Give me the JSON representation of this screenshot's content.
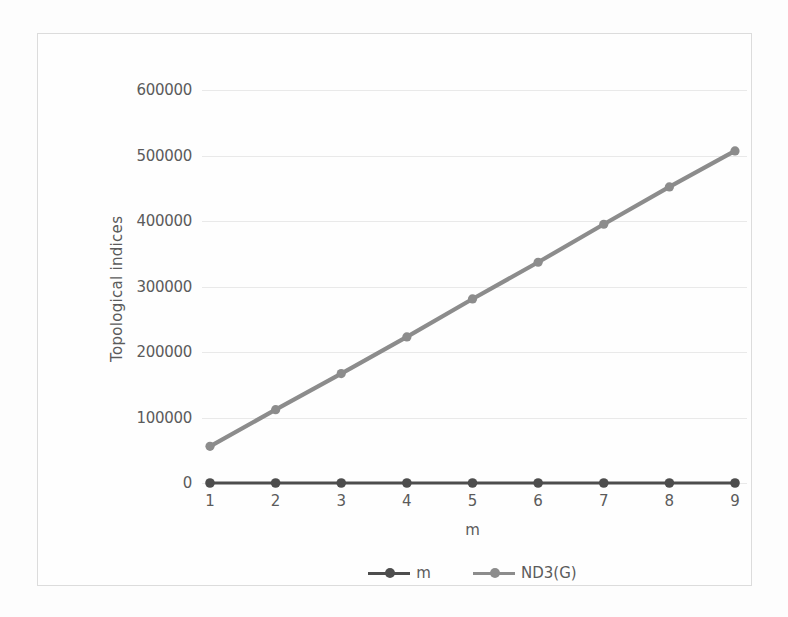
{
  "chart_data": {
    "type": "line",
    "title": "",
    "xlabel": "m",
    "ylabel": "Topological indices",
    "x": [
      1,
      2,
      3,
      4,
      5,
      6,
      7,
      8,
      9
    ],
    "xticklabels": [
      "1",
      "2",
      "3",
      "4",
      "5",
      "6",
      "7",
      "8",
      "9"
    ],
    "yticklabels": [
      "0",
      "100000",
      "200000",
      "300000",
      "400000",
      "500000",
      "600000"
    ],
    "yticks": [
      0,
      100000,
      200000,
      300000,
      400000,
      500000,
      600000
    ],
    "ylim": [
      0,
      600000
    ],
    "xlim": [
      1,
      9
    ],
    "grid": true,
    "legend_position": "bottom",
    "series": [
      {
        "name": "m",
        "color": "#4d4d4d",
        "marker": "circle",
        "values": [
          1,
          2,
          3,
          4,
          5,
          6,
          7,
          8,
          9
        ]
      },
      {
        "name": "ND3(G)",
        "color": "#8c8c8c",
        "marker": "circle",
        "values": [
          56000,
          112000,
          167000,
          223000,
          281000,
          337000,
          395000,
          452000,
          507000
        ]
      }
    ]
  },
  "legend": {
    "items": [
      {
        "label": "m"
      },
      {
        "label": "ND3(G)"
      }
    ]
  },
  "colors": {
    "series_m": "#4d4d4d",
    "series_nd3g": "#8c8c8c",
    "gridline": "#e9e9e9",
    "tick_text": "#5b5b5b",
    "frame_border": "#dcdcdc",
    "background": "#fefefe"
  }
}
